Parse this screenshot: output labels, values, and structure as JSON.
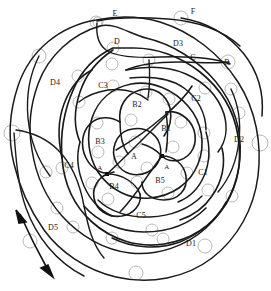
{
  "diagram": {
    "background_color": "#ffffff",
    "stroke_color": "#1a1a1a",
    "node_circle_color": "#b9b9b9",
    "marker_color": "#111111",
    "width": 271,
    "height": 291,
    "labels": [
      {
        "id": "A-center",
        "text": "A",
        "x": 134,
        "y": 156,
        "size": 8
      },
      {
        "id": "A-left",
        "text": "A",
        "x": 100,
        "y": 168,
        "size": 7
      },
      {
        "id": "A-right",
        "text": "A",
        "x": 167,
        "y": 167,
        "size": 7
      },
      {
        "id": "B1",
        "text": "B1",
        "x": 166,
        "y": 128,
        "size": 8
      },
      {
        "id": "B2",
        "text": "B2",
        "x": 137,
        "y": 104,
        "size": 8
      },
      {
        "id": "B3",
        "text": "B3",
        "x": 100,
        "y": 141,
        "size": 8
      },
      {
        "id": "B4",
        "text": "B4",
        "x": 114,
        "y": 186,
        "size": 8
      },
      {
        "id": "B5",
        "text": "B5",
        "x": 160,
        "y": 180,
        "size": 8
      },
      {
        "id": "C1",
        "text": "C1",
        "x": 203,
        "y": 172,
        "size": 8
      },
      {
        "id": "C2",
        "text": "C2",
        "x": 196,
        "y": 98,
        "size": 8
      },
      {
        "id": "C3",
        "text": "C3",
        "x": 103,
        "y": 85,
        "size": 8
      },
      {
        "id": "C4",
        "text": "C4",
        "x": 69,
        "y": 165,
        "size": 8
      },
      {
        "id": "C5",
        "text": "C5",
        "x": 141,
        "y": 215,
        "size": 8
      },
      {
        "id": "D1",
        "text": "D1",
        "x": 191,
        "y": 243,
        "size": 8
      },
      {
        "id": "D2",
        "text": "D2",
        "x": 239,
        "y": 139,
        "size": 8
      },
      {
        "id": "D3",
        "text": "D3",
        "x": 178,
        "y": 43,
        "size": 8
      },
      {
        "id": "D4",
        "text": "D4",
        "x": 55,
        "y": 82,
        "size": 8
      },
      {
        "id": "D5",
        "text": "D5",
        "x": 53,
        "y": 227,
        "size": 8
      },
      {
        "id": "C",
        "text": "C",
        "x": 193,
        "y": 57,
        "size": 8
      },
      {
        "id": "B",
        "text": "B",
        "x": 227,
        "y": 62,
        "size": 8
      },
      {
        "id": "D",
        "text": "D",
        "x": 117,
        "y": 41,
        "size": 8
      },
      {
        "id": "E",
        "text": "E",
        "x": 115,
        "y": 13,
        "size": 8
      },
      {
        "id": "F",
        "text": "F",
        "x": 193,
        "y": 11,
        "size": 8
      }
    ],
    "node_circles": [
      {
        "x": 96,
        "y": 22,
        "r": 6
      },
      {
        "x": 98,
        "y": 22,
        "r": 5
      },
      {
        "x": 181,
        "y": 18,
        "r": 7
      },
      {
        "x": 39,
        "y": 56,
        "r": 7
      },
      {
        "x": 113,
        "y": 48,
        "r": 6
      },
      {
        "x": 149,
        "y": 60,
        "r": 6
      },
      {
        "x": 228,
        "y": 62,
        "r": 7
      },
      {
        "x": 112,
        "y": 64,
        "r": 6
      },
      {
        "x": 78,
        "y": 76,
        "r": 6
      },
      {
        "x": 79,
        "y": 102,
        "r": 6
      },
      {
        "x": 113,
        "y": 86,
        "r": 6
      },
      {
        "x": 205,
        "y": 88,
        "r": 6
      },
      {
        "x": 146,
        "y": 92,
        "r": 6
      },
      {
        "x": 231,
        "y": 89,
        "r": 6
      },
      {
        "x": 12,
        "y": 133,
        "r": 8
      },
      {
        "x": 260,
        "y": 143,
        "r": 8
      },
      {
        "x": 239,
        "y": 113,
        "r": 6
      },
      {
        "x": 204,
        "y": 133,
        "r": 6
      },
      {
        "x": 169,
        "y": 99,
        "r": 6
      },
      {
        "x": 131,
        "y": 120,
        "r": 6
      },
      {
        "x": 97,
        "y": 123,
        "r": 6
      },
      {
        "x": 181,
        "y": 122,
        "r": 6
      },
      {
        "x": 135,
        "y": 142,
        "r": 6
      },
      {
        "x": 173,
        "y": 147,
        "r": 6
      },
      {
        "x": 98,
        "y": 152,
        "r": 6
      },
      {
        "x": 119,
        "y": 162,
        "r": 6
      },
      {
        "x": 62,
        "y": 168,
        "r": 6
      },
      {
        "x": 204,
        "y": 156,
        "r": 6
      },
      {
        "x": 147,
        "y": 168,
        "r": 6
      },
      {
        "x": 187,
        "y": 173,
        "r": 6
      },
      {
        "x": 46,
        "y": 172,
        "r": 6
      },
      {
        "x": 92,
        "y": 183,
        "r": 6
      },
      {
        "x": 137,
        "y": 182,
        "r": 6
      },
      {
        "x": 208,
        "y": 190,
        "r": 6
      },
      {
        "x": 232,
        "y": 196,
        "r": 6
      },
      {
        "x": 108,
        "y": 199,
        "r": 6
      },
      {
        "x": 168,
        "y": 193,
        "r": 6
      },
      {
        "x": 57,
        "y": 208,
        "r": 6
      },
      {
        "x": 30,
        "y": 241,
        "r": 7
      },
      {
        "x": 112,
        "y": 238,
        "r": 6
      },
      {
        "x": 163,
        "y": 239,
        "r": 6
      },
      {
        "x": 205,
        "y": 246,
        "r": 7
      },
      {
        "x": 73,
        "y": 227,
        "r": 6
      },
      {
        "x": 136,
        "y": 273,
        "r": 7
      },
      {
        "x": 152,
        "y": 230,
        "r": 6
      }
    ],
    "square_markers": [
      {
        "x": 107,
        "y": 174,
        "size": 4
      },
      {
        "x": 162,
        "y": 156,
        "size": 4
      }
    ],
    "arrow": {
      "id": "double-headed-arrow",
      "x1": 16,
      "y1": 212,
      "x2": 52,
      "y2": 276
    }
  }
}
